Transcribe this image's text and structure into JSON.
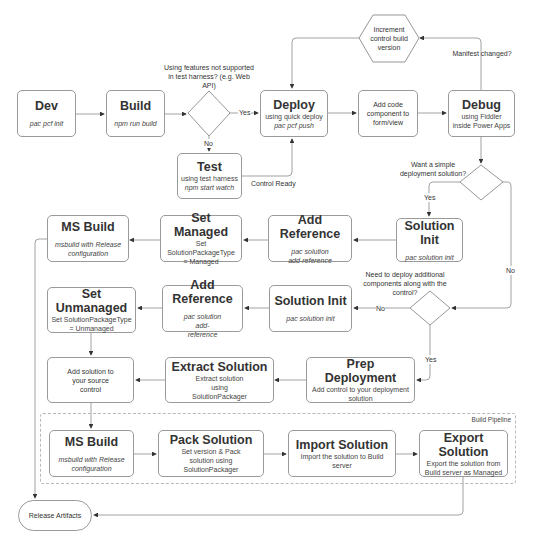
{
  "nodes": {
    "dev": {
      "title": "Dev",
      "cmd": "pac pcf init"
    },
    "build": {
      "title": "Build",
      "cmd": "npm run build"
    },
    "deploy": {
      "title": "Deploy",
      "sub": "using quick deploy",
      "cmd": "pac pcf push"
    },
    "add_code": {
      "text": "Add code component to form/view"
    },
    "debug": {
      "title": "Debug",
      "sub": "using Fiddler inside Power Apps"
    },
    "increment": {
      "text": "Increment control build version"
    },
    "test": {
      "title": "Test",
      "sub": "using test harness",
      "cmd": "npm start watch"
    },
    "solution_init_1": {
      "title": "Solution Init",
      "cmd": "pac solution init"
    },
    "add_reference_1": {
      "title": "Add Reference",
      "cmd": "pac solution add-reference"
    },
    "set_managed": {
      "title": "Set Managed",
      "sub": "Set SolutionPackageType = Managed"
    },
    "ms_build_1": {
      "title": "MS Build",
      "cmd": "msbuild with Release configuration"
    },
    "solution_init_2": {
      "title": "Solution Init",
      "cmd": "pac solution init"
    },
    "add_reference_2": {
      "title": "Add Reference",
      "cmd": "pac solution add-reference"
    },
    "set_unmanaged": {
      "title": "Set Unmanaged",
      "sub": "Set SolutionPackageType = Unmanaged"
    },
    "add_source": {
      "text": "Add solution to your source control"
    },
    "extract_solution": {
      "title": "Extract Solution",
      "sub": "Extract solution using SolutionPackager"
    },
    "prep_deployment": {
      "title": "Prep Deployment",
      "sub": "Add control to your deployment solution"
    },
    "ms_build_2": {
      "title": "MS Build",
      "cmd": "msbuild with Release configuration"
    },
    "pack_solution": {
      "title": "Pack Solution",
      "sub": "Set version & Pack solution using SolutionPackager"
    },
    "import_solution": {
      "title": "Import Solution",
      "sub": "Import the solution to Build server"
    },
    "export_solution": {
      "title": "Export Solution",
      "sub": "Export the solution from Build server as Managed"
    },
    "release_artifacts": {
      "text": "Release Artifacts"
    }
  },
  "decisions": {
    "test_harness": "Using features not supported in test harness? (e.g. Web API)",
    "simple_deploy": "Want a simple deployment solution?",
    "additional_components": "Need to deploy additional components along with the control?",
    "manifest_changed": "Manifest changed?"
  },
  "edge_labels": {
    "yes": "Yes",
    "no": "No",
    "control_ready": "Control Ready"
  },
  "groups": {
    "build_pipeline": "Build Pipeline"
  }
}
